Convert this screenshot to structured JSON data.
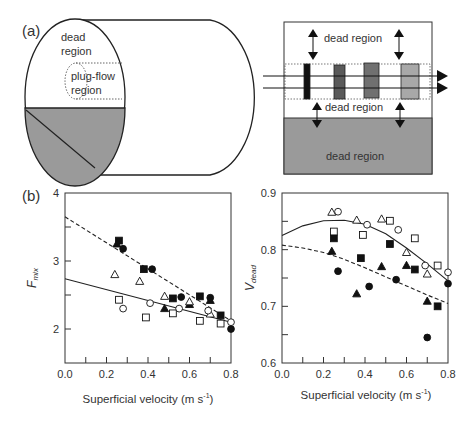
{
  "panel_a": {
    "label": "(a)",
    "cylinder": {
      "dead_label_1": "dead",
      "dead_label_2": "region",
      "plug_label_1": "plug-flow",
      "plug_label_2": "region",
      "fill_color": "#9a9a9a"
    },
    "schematic": {
      "top_label": "dead region",
      "middle_label": "dead region",
      "bottom_label": "dead region",
      "tracer_colors": [
        "#111111",
        "#5a5a5a",
        "#707070",
        "#a8a8a8"
      ],
      "bottom_fill": "#9a9a9a"
    }
  },
  "panel_b": {
    "label": "(b)"
  },
  "chart_data": [
    {
      "type": "scatter",
      "title": "",
      "xlabel": "Superficial velocity (m s-1)",
      "ylabel": "F_mix",
      "ylabel_main": "F",
      "ylabel_sub": "mix",
      "xlabel_main": "Superficial velocity (m s",
      "xlabel_sup": "-1",
      "xlabel_end": ")",
      "xlim": [
        0.0,
        0.8
      ],
      "ylim": [
        1.5,
        4
      ],
      "xticks": [
        "0.0",
        "0.2",
        "0.4",
        "0.6",
        "0.8"
      ],
      "yticks": [
        "2",
        "3",
        "4"
      ],
      "grid": false,
      "series": [
        {
          "name": "filled-square",
          "marker": "square",
          "filled": true,
          "x": [
            0.26,
            0.38,
            0.52,
            0.65,
            0.75
          ],
          "y": [
            3.3,
            2.88,
            2.45,
            2.48,
            2.2
          ]
        },
        {
          "name": "filled-circle",
          "marker": "circle",
          "filled": true,
          "x": [
            0.28,
            0.42,
            0.56,
            0.7,
            0.8
          ],
          "y": [
            3.18,
            2.88,
            2.47,
            2.46,
            2.0
          ]
        },
        {
          "name": "filled-triangle",
          "marker": "triangle",
          "filled": true,
          "x": [
            0.25,
            0.48,
            0.6,
            0.7
          ],
          "y": [
            3.25,
            2.3,
            2.36,
            2.42
          ]
        },
        {
          "name": "open-triangle",
          "marker": "triangle",
          "filled": false,
          "x": [
            0.24,
            0.36,
            0.48,
            0.6,
            0.7
          ],
          "y": [
            2.8,
            2.7,
            2.48,
            2.4,
            2.22
          ]
        },
        {
          "name": "open-square",
          "marker": "square",
          "filled": false,
          "x": [
            0.26,
            0.39,
            0.52,
            0.65,
            0.75
          ],
          "y": [
            2.43,
            2.17,
            2.23,
            2.12,
            2.08
          ]
        },
        {
          "name": "open-circle",
          "marker": "circle",
          "filled": false,
          "x": [
            0.28,
            0.41,
            0.55,
            0.69,
            0.8
          ],
          "y": [
            2.3,
            2.38,
            2.3,
            2.27,
            2.1
          ]
        }
      ],
      "fit_lines": [
        {
          "name": "dashed-fit",
          "style": "dashed",
          "x": [
            0.0,
            0.8
          ],
          "y": [
            3.65,
            2.12
          ]
        },
        {
          "name": "solid-fit",
          "style": "solid",
          "x": [
            0.0,
            0.8
          ],
          "y": [
            2.74,
            2.1
          ]
        }
      ]
    },
    {
      "type": "scatter",
      "title": "",
      "xlabel": "Superficial velocity (m s-1)",
      "ylabel": "V_dead",
      "ylabel_main": "V",
      "ylabel_sub": "dead",
      "xlabel_main": "Superficial velocity (m s",
      "xlabel_sup": "-1",
      "xlabel_end": ")",
      "xlim": [
        0.0,
        0.8
      ],
      "ylim": [
        0.6,
        0.9
      ],
      "xticks": [
        "0.0",
        "0.2",
        "0.4",
        "0.6",
        "0.8"
      ],
      "yticks": [
        "0.6",
        "0.7",
        "0.8",
        "0.9"
      ],
      "grid": false,
      "series": [
        {
          "name": "filled-square",
          "marker": "square",
          "filled": true,
          "x": [
            0.25,
            0.38,
            0.52,
            0.64,
            0.75
          ],
          "y": [
            0.82,
            0.785,
            0.81,
            0.765,
            0.7
          ]
        },
        {
          "name": "filled-circle",
          "marker": "circle",
          "filled": true,
          "x": [
            0.27,
            0.42,
            0.55,
            0.7,
            0.8
          ],
          "y": [
            0.762,
            0.735,
            0.747,
            0.645,
            0.74
          ]
        },
        {
          "name": "filled-triangle",
          "marker": "triangle",
          "filled": true,
          "x": [
            0.24,
            0.36,
            0.48,
            0.6,
            0.7
          ],
          "y": [
            0.797,
            0.722,
            0.77,
            0.772,
            0.709
          ]
        },
        {
          "name": "open-triangle",
          "marker": "triangle",
          "filled": false,
          "x": [
            0.24,
            0.36,
            0.48,
            0.6,
            0.7
          ],
          "y": [
            0.866,
            0.852,
            0.854,
            0.795,
            0.757
          ]
        },
        {
          "name": "open-square",
          "marker": "square",
          "filled": false,
          "x": [
            0.25,
            0.39,
            0.52,
            0.64,
            0.75
          ],
          "y": [
            0.832,
            0.826,
            0.851,
            0.82,
            0.772
          ]
        },
        {
          "name": "open-circle",
          "marker": "circle",
          "filled": false,
          "x": [
            0.27,
            0.41,
            0.56,
            0.69,
            0.8
          ],
          "y": [
            0.867,
            0.844,
            0.835,
            0.772,
            0.76
          ]
        }
      ],
      "fit_lines": [
        {
          "name": "solid-fit",
          "style": "solid",
          "x": [
            0.0,
            0.1,
            0.2,
            0.3,
            0.4,
            0.5,
            0.6,
            0.7,
            0.8
          ],
          "y": [
            0.825,
            0.842,
            0.851,
            0.852,
            0.845,
            0.828,
            0.803,
            0.775,
            0.745
          ]
        },
        {
          "name": "dashed-fit",
          "style": "dashed",
          "x": [
            0.0,
            0.1,
            0.2,
            0.3,
            0.4,
            0.5,
            0.6,
            0.7,
            0.8
          ],
          "y": [
            0.808,
            0.803,
            0.795,
            0.783,
            0.768,
            0.752,
            0.736,
            0.72,
            0.705
          ]
        }
      ]
    }
  ]
}
